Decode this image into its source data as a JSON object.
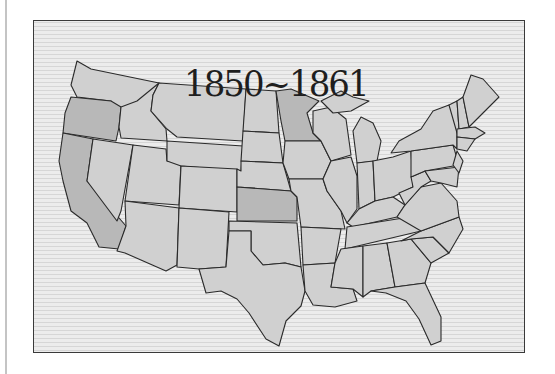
{
  "map": {
    "title": "1850~1861",
    "region": "Contiguous United States",
    "colors": {
      "background": "#ececec",
      "stripe": "#d2d2d2",
      "state_default": "#d0d0d0",
      "state_highlight": "#b8b8b8",
      "border": "#2a2a2a",
      "frame": "#3a3a3a"
    },
    "highlighted_states": [
      "California",
      "Oregon",
      "Minnesota",
      "Kansas"
    ]
  }
}
